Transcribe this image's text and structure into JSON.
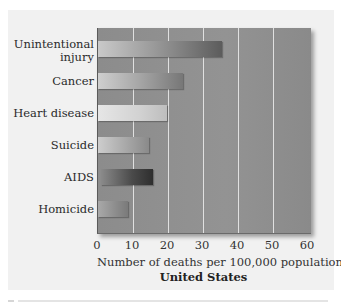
{
  "chart_data": {
    "type": "bar",
    "orientation": "horizontal",
    "title": "",
    "subtitle": "United States",
    "xlabel": "Number of deaths per 100,000 population",
    "ylabel": "",
    "xlim": [
      0,
      60
    ],
    "x_ticks": [
      "0",
      "10",
      "20",
      "30",
      "40",
      "50",
      "60"
    ],
    "grid": true,
    "legend": null,
    "categories": [
      "Unintentional injury",
      "Cancer",
      "Heart disease",
      "Suicide",
      "AIDS",
      "Homicide"
    ],
    "values": [
      35,
      24,
      19.5,
      14.5,
      15.5,
      8.5
    ]
  },
  "labels": {
    "cat0_line1": "Unintentional",
    "cat0_line2": "injury",
    "cat1": "Cancer",
    "cat2": "Heart disease",
    "cat3": "Suicide",
    "cat4": "AIDS",
    "cat5": "Homicide"
  },
  "colors": {
    "plot_bg": "#8f8f8f",
    "gridline": "#e9e9e9",
    "panel_bg": "#f1f1f1"
  }
}
